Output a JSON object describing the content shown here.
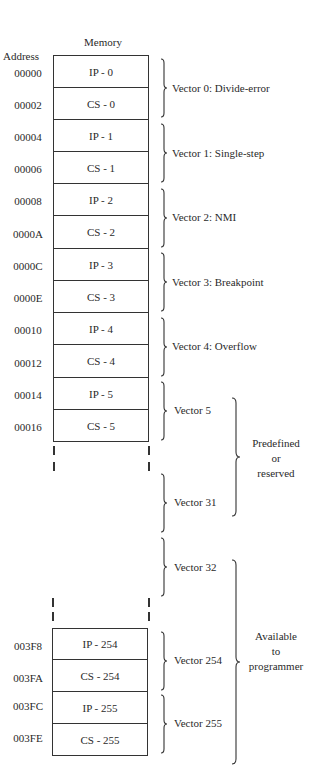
{
  "diagram": {
    "column_title": "Memory",
    "address_header": "Address",
    "upper_table": [
      {
        "address": "00000",
        "content": "IP - 0"
      },
      {
        "address": "00002",
        "content": "CS - 0"
      },
      {
        "address": "00004",
        "content": "IP - 1"
      },
      {
        "address": "00006",
        "content": "CS - 1"
      },
      {
        "address": "00008",
        "content": "IP - 2"
      },
      {
        "address": "0000A",
        "content": "CS - 2"
      },
      {
        "address": "0000C",
        "content": "IP - 3"
      },
      {
        "address": "0000E",
        "content": "CS - 3"
      },
      {
        "address": "00010",
        "content": "IP - 4"
      },
      {
        "address": "00012",
        "content": "CS - 4"
      },
      {
        "address": "00014",
        "content": "IP - 5"
      },
      {
        "address": "00016",
        "content": "CS - 5"
      }
    ],
    "lower_table": [
      {
        "address": "003F8",
        "content": "IP - 254"
      },
      {
        "address": "003FA",
        "content": "CS - 254"
      },
      {
        "address": "003FC",
        "content": "IP - 255"
      },
      {
        "address": "003FE",
        "content": "CS - 255"
      }
    ],
    "vectors": [
      {
        "label": "Vector 0: Divide-error"
      },
      {
        "label": "Vector 1: Single-step"
      },
      {
        "label": "Vector 2: NMI"
      },
      {
        "label": "Vector 3: Breakpoint"
      },
      {
        "label": "Vector 4: Overflow"
      },
      {
        "label": "Vector 5"
      },
      {
        "label": "Vector 31"
      },
      {
        "label": "Vector 32"
      },
      {
        "label": "Vector 254"
      },
      {
        "label": "Vector 255"
      }
    ],
    "groups": [
      {
        "lines": [
          "Predefined",
          "or",
          "reserved"
        ]
      },
      {
        "lines": [
          "Available",
          "to",
          "programmer"
        ]
      }
    ]
  }
}
